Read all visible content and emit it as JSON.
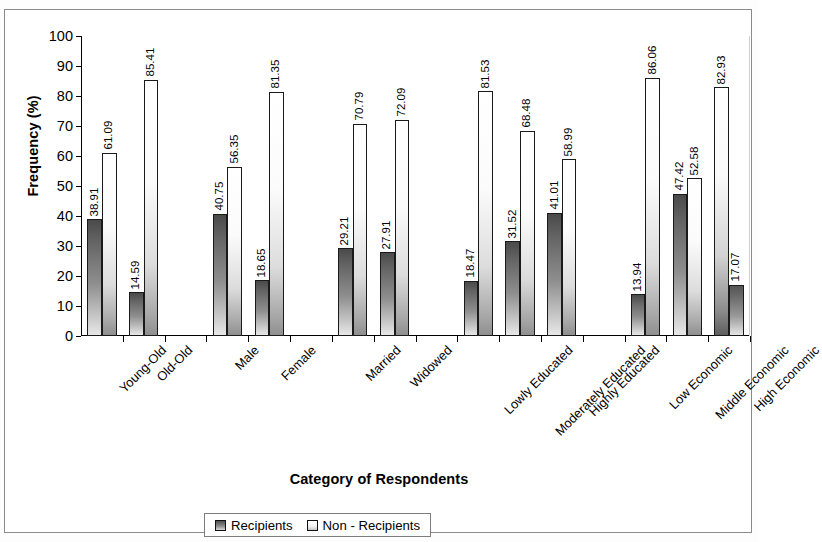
{
  "chart_data": {
    "type": "bar",
    "title": "",
    "xlabel": "Category of Respondents",
    "ylabel": "Frequency (%)",
    "ylim": [
      0,
      100
    ],
    "yticks": [
      0,
      10,
      20,
      30,
      40,
      50,
      60,
      70,
      80,
      90,
      100
    ],
    "grid": false,
    "legend_position": "bottom",
    "categories": [
      "Young-Old",
      "Old-Old",
      "Male",
      "Female",
      "Married",
      "Widowed",
      "Lowly Educated",
      "Moderately Educated",
      "Highly Educated",
      "Low Economic",
      "Middle Economic",
      "High Economic"
    ],
    "series": [
      {
        "name": "Recipients",
        "values": [
          38.91,
          14.59,
          40.75,
          18.65,
          29.21,
          27.91,
          18.47,
          31.52,
          41.01,
          13.94,
          47.42,
          82.93
        ]
      },
      {
        "name": "Non - Recipients",
        "values": [
          61.09,
          85.41,
          56.35,
          81.35,
          70.79,
          72.09,
          81.53,
          68.48,
          58.99,
          86.06,
          52.58,
          17.07
        ]
      }
    ],
    "groups": [
      {
        "name": "Age",
        "categories": [
          "Young-Old",
          "Old-Old"
        ]
      },
      {
        "name": "Sex",
        "categories": [
          "Male",
          "Female"
        ]
      },
      {
        "name": "Marital Status",
        "categories": [
          "Married",
          "Widowed"
        ]
      },
      {
        "name": "Education",
        "categories": [
          "Lowly Educated",
          "Moderately Educated",
          "Highly Educated"
        ]
      },
      {
        "name": "Economic Status",
        "categories": [
          "Low Economic",
          "Middle Economic",
          "High Economic"
        ]
      }
    ],
    "bar_styles": [
      [
        "recipients",
        "nonrecipients"
      ],
      [
        "recipients",
        "nonrecipients"
      ],
      [
        "recipients",
        "nonrecipients"
      ],
      [
        "recipients",
        "nonrecipients"
      ],
      [
        "recipients",
        "nonrecipients"
      ],
      [
        "recipients",
        "nonrecipients"
      ],
      [
        "recipients",
        "nonrecipients"
      ],
      [
        "recipients",
        "nonrecipients"
      ],
      [
        "recipients",
        "nonrecipients"
      ],
      [
        "recipients",
        "nonrecipients"
      ],
      [
        "recipients",
        "nonrecipients"
      ],
      [
        "recipients-inverted",
        "nonrecipients-dark"
      ]
    ]
  },
  "legend": {
    "items": [
      {
        "label": "Recipients",
        "swatch": "recipients"
      },
      {
        "label": "Non - Recipients",
        "swatch": "nonrecipients"
      }
    ]
  },
  "colors": {
    "recipients_dark": "#4a4a4a",
    "recipients_light": "#e8e8e8",
    "nonrecipients_light": "#ffffff",
    "nonrecipients_dark": "#8f8f8f",
    "axis": "#000000",
    "frame": "#8a8a8a",
    "background": "#ffffff"
  }
}
